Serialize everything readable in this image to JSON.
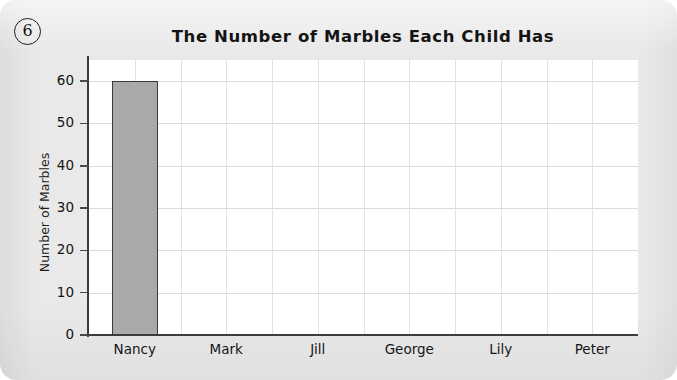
{
  "worksheet": {
    "question_number": "6"
  },
  "chart_data": {
    "type": "bar",
    "title": "The Number of Marbles Each Child Has",
    "xlabel": "",
    "ylabel": "Number of Marbles",
    "categories": [
      "Nancy",
      "Mark",
      "Jill",
      "George",
      "Lily",
      "Peter"
    ],
    "values": [
      60,
      0,
      0,
      0,
      0,
      0
    ],
    "ylim": [
      0,
      65
    ],
    "yticks": [
      0,
      10,
      20,
      30,
      40,
      50,
      60
    ],
    "ytick_labels": [
      "0",
      "10",
      "20",
      "30",
      "40",
      "50",
      "60"
    ],
    "grid": true,
    "legend": false,
    "bar_fill_color": "#a9a9a9",
    "bar_border_color": "#3a3a3a",
    "gridline_color": "#dcdcdc",
    "axis_color": "#3b3b3b",
    "plot_background": "#ffffff",
    "page_background": "#e9e9e9"
  }
}
